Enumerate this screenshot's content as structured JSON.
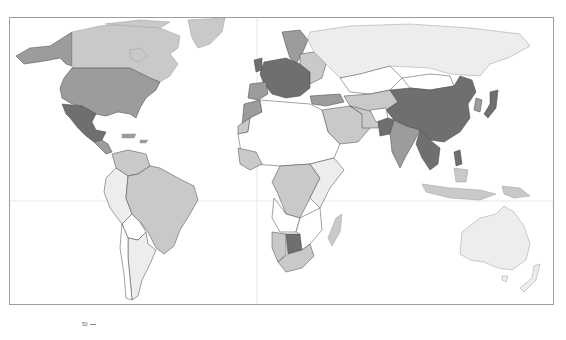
{
  "map": {
    "type": "choropleth world map",
    "palette": {
      "none": "#ffffff",
      "very_low": "#ededed",
      "low": "#c9c9c9",
      "medium": "#9c9c9c",
      "high": "#6f6f6f",
      "border": "#444444",
      "frame": "#9d9d9d",
      "graticule": "#dddddd"
    },
    "regions": [
      {
        "name": "Alaska",
        "level": "medium"
      },
      {
        "name": "Canada",
        "level": "low"
      },
      {
        "name": "Greenland",
        "level": "low"
      },
      {
        "name": "United States",
        "level": "medium"
      },
      {
        "name": "Mexico",
        "level": "high"
      },
      {
        "name": "Brazil",
        "level": "low"
      },
      {
        "name": "Argentina",
        "level": "very_low"
      },
      {
        "name": "Russia",
        "level": "very_low"
      },
      {
        "name": "Western Europe",
        "level": "high"
      },
      {
        "name": "China",
        "level": "high"
      },
      {
        "name": "Mongolia",
        "level": "none"
      },
      {
        "name": "India",
        "level": "medium"
      },
      {
        "name": "Japan",
        "level": "high"
      },
      {
        "name": "Southeast Asia",
        "level": "high"
      },
      {
        "name": "Indonesia",
        "level": "low"
      },
      {
        "name": "Australia",
        "level": "very_low"
      },
      {
        "name": "Central Africa",
        "level": "low"
      },
      {
        "name": "Botswana",
        "level": "high"
      },
      {
        "name": "South Africa",
        "level": "low"
      },
      {
        "name": "Madagascar",
        "level": "low"
      }
    ]
  },
  "legend": {
    "label": "50",
    "dash": "—"
  }
}
